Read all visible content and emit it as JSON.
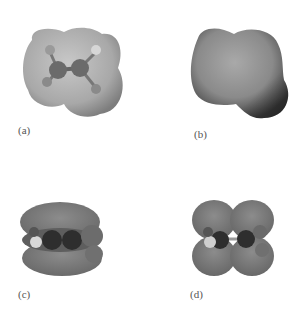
{
  "figure": {
    "panels": [
      {
        "id": "a",
        "label": "(a)",
        "description": "ball-and-stick ethylene inside translucent electron density surface"
      },
      {
        "id": "b",
        "label": "(b)",
        "description": "opaque shaded electrostatic potential surface"
      },
      {
        "id": "c",
        "label": "(c)",
        "description": "pi bonding orbital lobes above and below molecular plane"
      },
      {
        "id": "d",
        "label": "(d)",
        "description": "pi antibonding orbital with four lobes and a nodal plane"
      }
    ],
    "colors": {
      "surface_light": "#bdbdbd",
      "surface_dark": "#5a5a5a",
      "orbital": "#7a7a7a",
      "atom_carbon": "#2e2e2e",
      "atom_hydrogen": "#d8d8d8"
    }
  }
}
